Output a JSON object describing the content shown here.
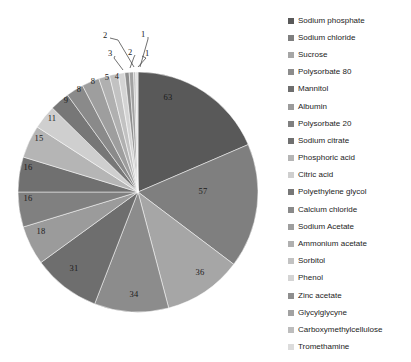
{
  "chart_data": {
    "type": "pie",
    "title": "",
    "xlabel": "",
    "ylabel": "",
    "legend_position": "right",
    "grid": false,
    "total": 340,
    "start_angle_deg": 0,
    "direction": "clockwise",
    "categories": [
      "Sodium phosphate",
      "Sodium chloride",
      "Sucrose",
      "Polysorbate 80",
      "Mannitol",
      "Albumin",
      "Polysorbate 20",
      "Sodium citrate",
      "Phosphoric acid",
      "Citric acid",
      "Polyethylene glycol",
      "Calcium chloride",
      "Sodium Acetate",
      "Ammonium acetate",
      "Sorbitol",
      "Phenol",
      "Zinc acetate",
      "Glycylglycyne",
      "Carboxymethylcellulose",
      "Tromethamine"
    ],
    "values": [
      63,
      57,
      36,
      34,
      31,
      18,
      16,
      16,
      15,
      11,
      9,
      8,
      8,
      5,
      4,
      3,
      2,
      2,
      1,
      1
    ],
    "colors": [
      "#595959",
      "#7f7f7f",
      "#a6a6a6",
      "#8c8c8c",
      "#6e6e6e",
      "#9b9b9b",
      "#808080",
      "#707070",
      "#b5b5b5",
      "#cfcfcf",
      "#777777",
      "#8a8a8a",
      "#9e9e9e",
      "#b0b0b0",
      "#c2c2c2",
      "#d4d4d4",
      "#8e8e8e",
      "#a2a2a2",
      "#bdbdbd",
      "#dcdcdc"
    ],
    "labels_shown": [
      {
        "value": "63",
        "kind": "inside"
      },
      {
        "value": "57",
        "kind": "inside"
      },
      {
        "value": "36",
        "kind": "inside"
      },
      {
        "value": "34",
        "kind": "inside"
      },
      {
        "value": "31",
        "kind": "inside"
      },
      {
        "value": "18",
        "kind": "inside"
      },
      {
        "value": "16",
        "kind": "inside"
      },
      {
        "value": "16",
        "kind": "inside"
      },
      {
        "value": "15",
        "kind": "inside"
      },
      {
        "value": "11",
        "kind": "inside"
      },
      {
        "value": "9",
        "kind": "inside"
      },
      {
        "value": "8",
        "kind": "inside"
      },
      {
        "value": "8",
        "kind": "inside"
      },
      {
        "value": "5",
        "kind": "inside"
      },
      {
        "value": "4",
        "kind": "inside"
      },
      {
        "value": "3",
        "kind": "callout"
      },
      {
        "value": "2",
        "kind": "callout"
      },
      {
        "value": "2",
        "kind": "callout"
      },
      {
        "value": "1",
        "kind": "callout"
      },
      {
        "value": "1",
        "kind": "callout"
      }
    ]
  },
  "pie": {
    "slice_labels": [
      {
        "text": "63",
        "x": 168,
        "y": 97
      },
      {
        "text": "57",
        "x": 203,
        "y": 191
      },
      {
        "text": "36",
        "x": 200,
        "y": 272
      },
      {
        "text": "34",
        "x": 134,
        "y": 294
      },
      {
        "text": "31",
        "x": 74,
        "y": 268
      },
      {
        "text": "18",
        "x": 41,
        "y": 231
      },
      {
        "text": "16",
        "x": 28,
        "y": 198
      },
      {
        "text": "16",
        "x": 28,
        "y": 167
      },
      {
        "text": "15",
        "x": 39,
        "y": 138
      },
      {
        "text": "11",
        "x": 52,
        "y": 118
      },
      {
        "text": "9",
        "x": 66,
        "y": 100
      },
      {
        "text": "8",
        "x": 79,
        "y": 89
      },
      {
        "text": "8",
        "x": 93,
        "y": 81
      },
      {
        "text": "5",
        "x": 107,
        "y": 77
      },
      {
        "text": "4",
        "x": 117,
        "y": 76
      }
    ],
    "callout_labels": [
      {
        "text": "3",
        "x": 110,
        "y": 53
      },
      {
        "text": "2",
        "x": 130,
        "y": 52
      },
      {
        "text": "2",
        "x": 105,
        "y": 35
      },
      {
        "text": "1",
        "x": 147,
        "y": 53
      },
      {
        "text": "1",
        "x": 143,
        "y": 34
      }
    ]
  },
  "legend": {
    "items": [
      {
        "label": "Sodium phosphate",
        "color": "#595959"
      },
      {
        "label": "Sodium chloride",
        "color": "#7f7f7f"
      },
      {
        "label": "Sucrose",
        "color": "#a6a6a6"
      },
      {
        "label": "Polysorbate 80",
        "color": "#8c8c8c"
      },
      {
        "label": "Mannitol",
        "color": "#6e6e6e"
      },
      {
        "label": "Albumin",
        "color": "#9b9b9b"
      },
      {
        "label": "Polysorbate 20",
        "color": "#808080"
      },
      {
        "label": "Sodium citrate",
        "color": "#707070"
      },
      {
        "label": "Phosphoric acid",
        "color": "#b5b5b5"
      },
      {
        "label": "Citric acid",
        "color": "#cfcfcf"
      },
      {
        "label": "Polyethylene glycol",
        "color": "#777777"
      },
      {
        "label": "Calcium chloride",
        "color": "#8a8a8a"
      },
      {
        "label": "Sodium Acetate",
        "color": "#9e9e9e"
      },
      {
        "label": "Ammonium acetate",
        "color": "#b0b0b0"
      },
      {
        "label": "Sorbitol",
        "color": "#c2c2c2"
      },
      {
        "label": "Phenol",
        "color": "#d4d4d4"
      },
      {
        "label": "Zinc acetate",
        "color": "#8e8e8e"
      },
      {
        "label": "Glycylglycyne",
        "color": "#a2a2a2"
      },
      {
        "label": "Carboxymethylcellulose",
        "color": "#bdbdbd"
      },
      {
        "label": "Tromethamine",
        "color": "#dcdcdc"
      }
    ]
  }
}
